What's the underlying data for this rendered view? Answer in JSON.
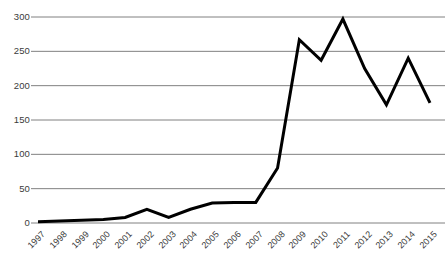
{
  "chart_data": {
    "type": "line",
    "title": "",
    "subtitle": "",
    "xlabel": "",
    "ylabel": "",
    "categories": [
      "1997",
      "1998",
      "1999",
      "2000",
      "2001",
      "2002",
      "2003",
      "2004",
      "2005",
      "2006",
      "2007",
      "2008",
      "2009",
      "2010",
      "2011",
      "2012",
      "2013",
      "2014",
      "2015"
    ],
    "values": [
      2,
      3,
      4,
      5,
      8,
      20,
      8,
      20,
      29,
      30,
      30,
      80,
      267,
      237,
      297,
      225,
      172,
      240,
      175
    ],
    "series": [
      {
        "name": "series-1",
        "values": [
          2,
          3,
          4,
          5,
          8,
          20,
          8,
          20,
          29,
          30,
          30,
          80,
          267,
          237,
          297,
          225,
          172,
          240,
          175
        ]
      }
    ],
    "ylim": [
      0,
      300
    ],
    "yticks": [
      0,
      50,
      100,
      150,
      200,
      250,
      300
    ],
    "ytick_labels": [
      "0",
      "50",
      "100",
      "150",
      "200",
      "250",
      "300"
    ],
    "xtick_labels": [
      "1997",
      "1998",
      "1999",
      "2000",
      "2001",
      "2002",
      "2003",
      "2004",
      "2005",
      "2006",
      "2007",
      "2008",
      "2009",
      "2010",
      "2011",
      "2012",
      "2013",
      "2014",
      "2015"
    ],
    "grid": "horizontal",
    "legend": "none",
    "annotations": [],
    "colors": {
      "line": "#000000",
      "gridline": "#808080",
      "axis_text": "#3b3b3b",
      "background": "#ffffff"
    },
    "line_width": 3,
    "markers": "none"
  }
}
